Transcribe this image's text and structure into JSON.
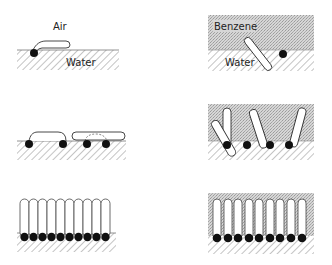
{
  "diagram": {
    "type": "surfactant-monolayer-schematic",
    "colors": {
      "background": "#ffffff",
      "line": "#333333",
      "head": "#111111",
      "hatch": "#888888",
      "benzene_fill": "#cfcfcf"
    },
    "panels": [
      {
        "id": "air-water-single",
        "labels": {
          "upper": "Air",
          "lower": "Water"
        },
        "phase_upper": "air",
        "molecules": 1,
        "orientation": "lying flat"
      },
      {
        "id": "benzene-water-single",
        "labels": {
          "upper": "Benzene",
          "lower": "Water"
        },
        "phase_upper": "benzene",
        "molecules": 1,
        "orientation": "tilted into benzene"
      },
      {
        "id": "air-water-low-density",
        "labels": {},
        "phase_upper": "air",
        "molecules": 4,
        "orientation": "lying flat, paired"
      },
      {
        "id": "benzene-water-low-density",
        "labels": {},
        "phase_upper": "benzene",
        "molecules": 4,
        "orientation": "tilted"
      },
      {
        "id": "air-water-close-packed",
        "labels": {},
        "phase_upper": "air",
        "molecules": 10,
        "orientation": "vertical, close packed"
      },
      {
        "id": "benzene-water-close-packed",
        "labels": {},
        "phase_upper": "benzene",
        "molecules": 9,
        "orientation": "vertical, spaced"
      }
    ]
  }
}
